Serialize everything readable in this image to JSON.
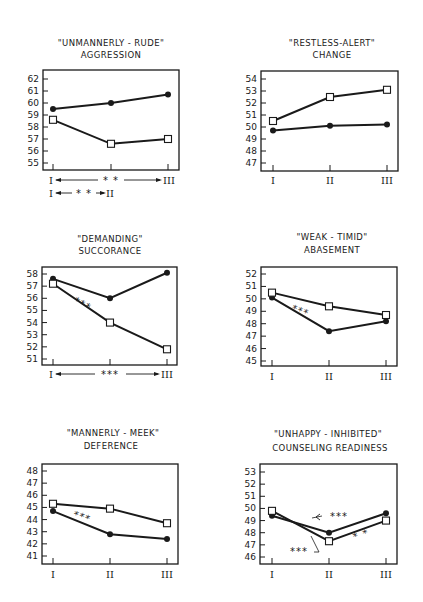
{
  "figure": {
    "x_categories": [
      "I",
      "II",
      "III"
    ],
    "legend_markers": {
      "filled_circle": "series A (solid dots)",
      "open_square": "series B (open squares)"
    },
    "line_color": "#1a1a1a",
    "background": "#ffffff"
  },
  "chart_data": [
    {
      "type": "line",
      "title": "\"UNMANNERLY - RUDE\"",
      "subtitle": "AGGRESSION",
      "categories": [
        "I",
        "II",
        "III"
      ],
      "yticks": [
        55,
        56,
        57,
        58,
        59,
        60,
        61,
        62
      ],
      "ylim": [
        54.8,
        62.5
      ],
      "series": [
        {
          "name": "filled_circle",
          "values": [
            59.5,
            60.0,
            60.7
          ]
        },
        {
          "name": "open_square",
          "values": [
            58.6,
            56.6,
            57.0
          ]
        }
      ],
      "annotations": [
        "I<—— ** ——>III",
        "I<— ** —>II"
      ]
    },
    {
      "type": "line",
      "title": "\"RESTLESS-ALERT\"",
      "subtitle": "CHANGE",
      "categories": [
        "I",
        "II",
        "III"
      ],
      "yticks": [
        47,
        48,
        49,
        50,
        51,
        52,
        53,
        54
      ],
      "ylim": [
        46.8,
        54.5
      ],
      "series": [
        {
          "name": "filled_circle",
          "values": [
            49.7,
            50.1,
            50.2
          ]
        },
        {
          "name": "open_square",
          "values": [
            50.5,
            52.5,
            53.1
          ]
        }
      ],
      "annotations": []
    },
    {
      "type": "line",
      "title": "\"DEMANDING\"",
      "subtitle": "SUCCORANCE",
      "categories": [
        "I",
        "II",
        "III"
      ],
      "yticks": [
        51,
        52,
        53,
        54,
        55,
        56,
        57,
        58
      ],
      "ylim": [
        50.8,
        58.5
      ],
      "series": [
        {
          "name": "filled_circle",
          "values": [
            57.6,
            56.0,
            58.1
          ]
        },
        {
          "name": "open_square",
          "values": [
            57.2,
            54.0,
            51.8
          ]
        }
      ],
      "annotations": [
        "***",
        "I<—— *** ——>III"
      ]
    },
    {
      "type": "line",
      "title": "\"WEAK - TIMID\"",
      "subtitle": "ABASEMENT",
      "categories": [
        "I",
        "II",
        "III"
      ],
      "yticks": [
        45,
        46,
        47,
        48,
        49,
        50,
        51,
        52
      ],
      "ylim": [
        44.8,
        52.5
      ],
      "series": [
        {
          "name": "filled_circle",
          "values": [
            50.1,
            47.4,
            48.2
          ]
        },
        {
          "name": "open_square",
          "values": [
            50.5,
            49.4,
            48.7
          ]
        }
      ],
      "annotations": [
        "***"
      ]
    },
    {
      "type": "line",
      "title": "\"MANNERLY - MEEK\"",
      "subtitle": "DEFERENCE",
      "categories": [
        "I",
        "II",
        "III"
      ],
      "yticks": [
        41,
        42,
        43,
        44,
        45,
        46,
        47,
        48
      ],
      "ylim": [
        40.8,
        48.5
      ],
      "series": [
        {
          "name": "filled_circle",
          "values": [
            44.7,
            42.8,
            42.4
          ]
        },
        {
          "name": "open_square",
          "values": [
            45.3,
            44.9,
            43.7
          ]
        }
      ],
      "annotations": [
        "***"
      ]
    },
    {
      "type": "line",
      "title": "\"UNHAPPY - INHIBITED\"",
      "subtitle": "COUNSELING READINESS",
      "categories": [
        "I",
        "II",
        "III"
      ],
      "yticks": [
        46,
        47,
        48,
        49,
        50,
        51,
        52,
        53
      ],
      "ylim": [
        45.8,
        53.5
      ],
      "series": [
        {
          "name": "filled_circle",
          "values": [
            49.4,
            48.0,
            49.6
          ]
        },
        {
          "name": "open_square",
          "values": [
            49.8,
            47.3,
            49.0
          ]
        }
      ],
      "annotations": [
        "***",
        "***",
        "**"
      ]
    }
  ],
  "panels": [
    {
      "title": "\"UNMANNERLY - RUDE\"",
      "subtitle": "AGGRESSION"
    },
    {
      "title": "\"RESTLESS-ALERT\"",
      "subtitle": "CHANGE"
    },
    {
      "title": "\"DEMANDING\"",
      "subtitle": "SUCCORANCE"
    },
    {
      "title": "\"WEAK - TIMID\"",
      "subtitle": "ABASEMENT"
    },
    {
      "title": "\"MANNERLY - MEEK\"",
      "subtitle": "DEFERENCE"
    },
    {
      "title": "\"UNHAPPY - INHIBITED\"",
      "subtitle": "COUNSELING READINESS"
    }
  ],
  "significance": {
    "three": "***",
    "two": "**",
    "two_spaced": "* *"
  }
}
